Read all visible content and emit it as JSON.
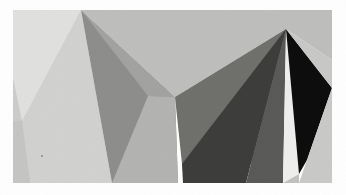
{
  "image": {
    "title": "Low-poly faceted grayscale abstract",
    "width": 346,
    "height": 195,
    "background_color": "#ffffff",
    "border": {
      "left": 13,
      "top": 10,
      "right": 332,
      "bottom": 183,
      "color": "#ffffff"
    },
    "palette": {
      "near_white": "#e3e3e2",
      "pale_gray": "#d6d6d4",
      "light_gray": "#cfcfcd",
      "soft_gray": "#c3c3c1",
      "mid_light_gray": "#b4b4b2",
      "mid_gray": "#9a9a98",
      "gray": "#8e8e8c",
      "medium_dark_gray": "#7b7b79",
      "dark_gray": "#5c5c5a",
      "charcoal": "#3c3c3b",
      "deep_charcoal": "#2a2a29",
      "near_black": "#0d0d0d",
      "highlight_white": "#f2f2f0"
    },
    "apexes": [
      {
        "name": "left-peak-apex",
        "x": 81,
        "y": 10
      },
      {
        "name": "right-peak-apex",
        "x": 286,
        "y": 29
      },
      {
        "name": "center-valley-vertex",
        "x": 175,
        "y": 97
      }
    ],
    "facets": [
      {
        "name": "left-backdrop-upper",
        "color": "#d9d9d7",
        "points": "13,10 81,10 60,95 13,78"
      },
      {
        "name": "left-backdrop-lower",
        "color": "#cdcdcb",
        "points": "13,78 60,95 30,183 13,183"
      },
      {
        "name": "left-peak-light-face",
        "color": "#e1e1df",
        "points": "81,10 60,95 22,121 13,78 13,10"
      },
      {
        "name": "left-peak-front-face",
        "color": "#d2d2d0",
        "points": "81,10 22,121 30,183 112,183"
      },
      {
        "name": "left-peak-lower-wedge",
        "color": "#c6c6c4",
        "points": "22,121 30,183 13,183 13,121"
      },
      {
        "name": "left-peak-shadow-face",
        "color": "#8e8e8c",
        "points": "81,10 175,97 178,183 112,183"
      },
      {
        "name": "center-ridge-face",
        "color": "#a3a3a1",
        "points": "81,10 148,96 175,97"
      },
      {
        "name": "center-valley-left-face",
        "color": "#b4b4b2",
        "points": "148,96 175,97 178,183 112,183"
      },
      {
        "name": "right-backdrop-upper",
        "color": "#bfbfbd",
        "points": "81,10 332,10 332,60 286,29 175,97"
      },
      {
        "name": "right-peak-left-face",
        "color": "#6f6f6d",
        "points": "286,29 175,97 182,164 283,162"
      },
      {
        "name": "center-dark-wedge",
        "color": "#3c3c3b",
        "points": "286,29 182,164 183,183 246,183"
      },
      {
        "name": "right-peak-mid-face",
        "color": "#5a5a58",
        "points": "286,29 246,183 283,183"
      },
      {
        "name": "right-peak-highlight-sliver",
        "color": "#efefed",
        "points": "286,29 283,183 299,174"
      },
      {
        "name": "right-peak-dark-face",
        "color": "#0d0d0d",
        "points": "286,29 332,88 307,160 299,174"
      },
      {
        "name": "right-backdrop-lower",
        "color": "#c9c9c7",
        "points": "332,60 332,88 286,29"
      },
      {
        "name": "right-edge-backdrop",
        "color": "#cacac8",
        "points": "332,88 332,183 299,183 307,160"
      },
      {
        "name": "bottom-right-backdrop",
        "color": "#c2c2c0",
        "points": "283,183 299,174 299,183"
      }
    ],
    "speck": {
      "name": "dust-speck",
      "x": 41,
      "y": 155,
      "size": 2,
      "color": "#9b9b99"
    }
  }
}
